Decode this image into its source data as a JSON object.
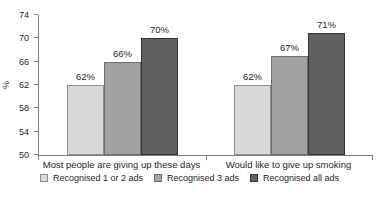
{
  "chart_data": {
    "type": "bar",
    "title": "",
    "ylabel": "%",
    "ylim": [
      50,
      74
    ],
    "yticks": [
      74,
      70,
      66,
      62,
      58,
      54,
      50
    ],
    "value_suffix": "%",
    "categories": [
      "Most people are giving up these days",
      "Would like to give up smoking"
    ],
    "series": [
      {
        "name": "Recognised 1 or 2 ads",
        "values": [
          62,
          62
        ],
        "color": "#d8d8d8",
        "border_color": "#8f8f8f"
      },
      {
        "name": "Recognised 3 ads",
        "values": [
          66,
          67
        ],
        "color": "#a2a2a2",
        "border_color": "#6e6e6e"
      },
      {
        "name": "Recognised all ads",
        "values": [
          70,
          71
        ],
        "color": "#606060",
        "border_color": "#343434"
      }
    ],
    "legend_position": "bottom",
    "grid": false,
    "data_labels": true,
    "axis_color": "#7f7f7f",
    "text_color": "#262626",
    "background_color": "#ffffff"
  }
}
